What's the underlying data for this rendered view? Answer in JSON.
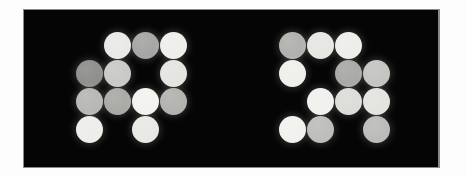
{
  "image": {
    "title": "Two clusters of illuminated circular discs on a black panel",
    "background_color": "#fdfdfd",
    "panel_color": "#050505",
    "panel_border_color": "#8a8a8a",
    "panel": {
      "x": 24,
      "y": 10,
      "width": 414,
      "height": 157
    },
    "disc_diameter": 27,
    "grid_pitch_x": 28,
    "grid_pitch_y": 28
  },
  "clusters": [
    {
      "name": "left-cluster",
      "label": "Left disc cluster",
      "origin_x": 76,
      "origin_y": 32,
      "columns": 4,
      "rows": 4,
      "discs": [
        {
          "row": 1,
          "col": 2,
          "color": "#e9e9e7",
          "brightness": 233
        },
        {
          "row": 1,
          "col": 3,
          "color": "#a5a5a3",
          "brightness": 165
        },
        {
          "row": 1,
          "col": 4,
          "color": "#eeeeea",
          "brightness": 238
        },
        {
          "row": 2,
          "col": 1,
          "color": "#8e8e8c",
          "brightness": 142
        },
        {
          "row": 2,
          "col": 2,
          "color": "#c9c9c6",
          "brightness": 201
        },
        {
          "row": 2,
          "col": 4,
          "color": "#e4e4e0",
          "brightness": 228
        },
        {
          "row": 3,
          "col": 1,
          "color": "#b7b7b4",
          "brightness": 183
        },
        {
          "row": 3,
          "col": 2,
          "color": "#a9a9a6",
          "brightness": 169
        },
        {
          "row": 3,
          "col": 3,
          "color": "#f2f2ee",
          "brightness": 242
        },
        {
          "row": 3,
          "col": 4,
          "color": "#b2b2af",
          "brightness": 178
        },
        {
          "row": 4,
          "col": 1,
          "color": "#ededea",
          "brightness": 237
        },
        {
          "row": 4,
          "col": 3,
          "color": "#e8e8e4",
          "brightness": 232
        }
      ]
    },
    {
      "name": "right-cluster",
      "label": "Right disc cluster",
      "origin_x": 279,
      "origin_y": 32,
      "columns": 4,
      "rows": 4,
      "discs": [
        {
          "row": 1,
          "col": 1,
          "color": "#b0b0ad",
          "brightness": 176
        },
        {
          "row": 1,
          "col": 2,
          "color": "#e6e6e2",
          "brightness": 230
        },
        {
          "row": 1,
          "col": 3,
          "color": "#ededea",
          "brightness": 237
        },
        {
          "row": 2,
          "col": 1,
          "color": "#efefec",
          "brightness": 239
        },
        {
          "row": 2,
          "col": 3,
          "color": "#a8a8a5",
          "brightness": 168
        },
        {
          "row": 2,
          "col": 4,
          "color": "#c4c4c1",
          "brightness": 196
        },
        {
          "row": 3,
          "col": 2,
          "color": "#f0f0ec",
          "brightness": 240
        },
        {
          "row": 3,
          "col": 3,
          "color": "#dcdcd8",
          "brightness": 220
        },
        {
          "row": 3,
          "col": 4,
          "color": "#e3e3df",
          "brightness": 227
        },
        {
          "row": 4,
          "col": 1,
          "color": "#f1f1ed",
          "brightness": 241
        },
        {
          "row": 4,
          "col": 2,
          "color": "#bdbdba",
          "brightness": 189
        },
        {
          "row": 4,
          "col": 4,
          "color": "#bbbbb8",
          "brightness": 187
        }
      ]
    }
  ]
}
